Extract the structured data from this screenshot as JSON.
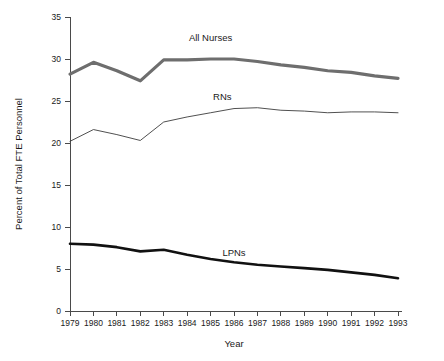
{
  "chart_data": {
    "type": "line",
    "title": "",
    "xlabel": "Year",
    "ylabel": "Percent of Total FTE Personnel",
    "categories": [
      "1979",
      "1980",
      "1981",
      "1982",
      "1983",
      "1984",
      "1985",
      "1986",
      "1987",
      "1988",
      "1989",
      "1990",
      "1991",
      "1992",
      "1993"
    ],
    "x": [
      1979,
      1980,
      1981,
      1982,
      1983,
      1984,
      1985,
      1986,
      1987,
      1988,
      1989,
      1990,
      1991,
      1992,
      1993
    ],
    "xlim": [
      1979,
      1993
    ],
    "ylim": [
      0,
      35
    ],
    "y_ticks": [
      0,
      5,
      10,
      15,
      20,
      25,
      30,
      35
    ],
    "x_ticks": [
      "1979",
      "1980",
      "1981",
      "1982",
      "1983",
      "1984",
      "1985",
      "1986",
      "1987",
      "1988",
      "1989",
      "1990",
      "1991",
      "1992",
      "1993"
    ],
    "grid": false,
    "legend_position": "inline-labels",
    "series": [
      {
        "name": "All Nurses",
        "color": "#6e6e6e",
        "stroke_width": 3.2,
        "label_x": 1985.0,
        "label_y": 32.1,
        "values": [
          28.2,
          29.6,
          28.6,
          27.4,
          29.9,
          29.9,
          30.0,
          30.0,
          29.7,
          29.3,
          29.0,
          28.6,
          28.4,
          28.0,
          27.7
        ]
      },
      {
        "name": "RNs",
        "color": "#3c3c3c",
        "stroke_width": 0.9,
        "label_x": 1985.5,
        "label_y": 25.1,
        "values": [
          20.2,
          21.6,
          21.0,
          20.3,
          22.5,
          23.1,
          23.6,
          24.1,
          24.2,
          23.9,
          23.8,
          23.6,
          23.7,
          23.7,
          23.6
        ]
      },
      {
        "name": "LPNs",
        "color": "#111111",
        "stroke_width": 2.6,
        "label_x": 1986.0,
        "label_y": 6.5,
        "values": [
          8.0,
          7.9,
          7.6,
          7.1,
          7.3,
          6.7,
          6.2,
          5.8,
          5.5,
          5.3,
          5.1,
          4.9,
          4.6,
          4.3,
          3.9
        ]
      }
    ]
  }
}
